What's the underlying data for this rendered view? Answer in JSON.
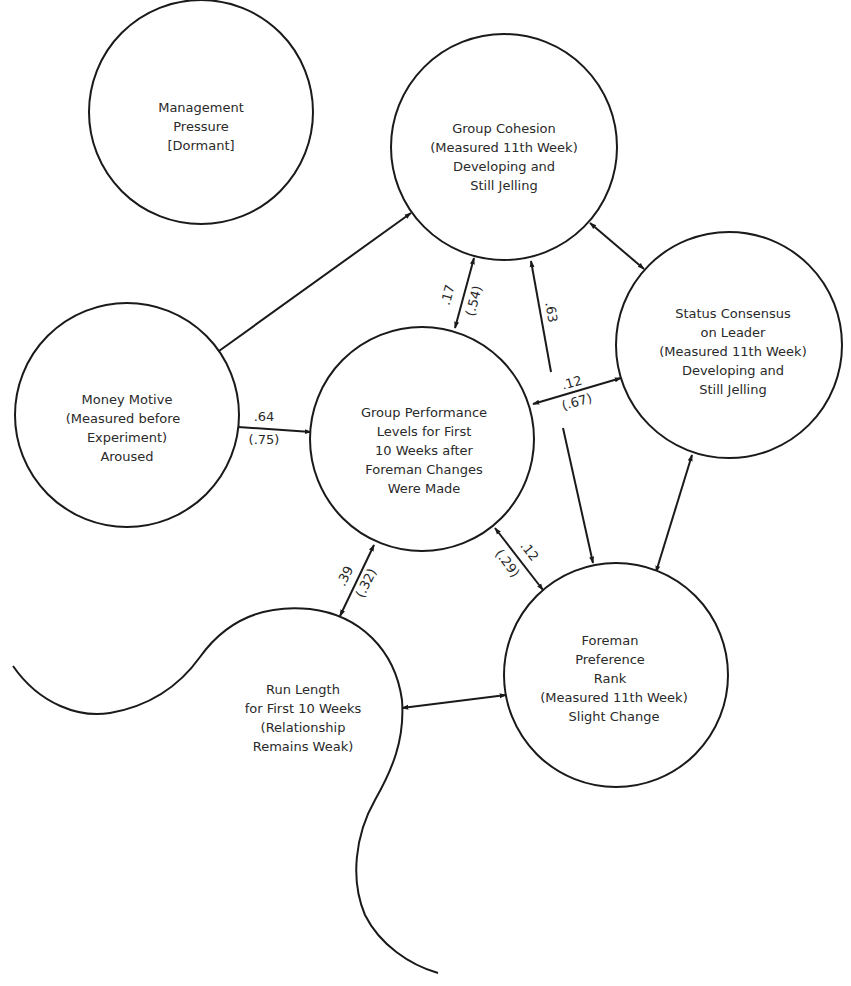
{
  "diagram": {
    "colors": {
      "line": "#1a1a1a",
      "text": "#2a2a2a",
      "background": "#ffffff"
    },
    "nodes": {
      "management_pressure": {
        "lines": [
          "Management",
          "Pressure",
          "[Dormant]"
        ]
      },
      "group_cohesion": {
        "lines": [
          "Group Cohesion",
          "(Measured 11th Week)",
          "Developing and",
          "Still Jelling"
        ]
      },
      "status_consensus": {
        "lines": [
          "Status Consensus",
          "on Leader",
          "(Measured 11th Week)",
          "Developing and",
          "Still Jelling"
        ]
      },
      "money_motive": {
        "lines": [
          "Money Motive",
          "(Measured before",
          "Experiment)",
          "Aroused"
        ]
      },
      "group_performance": {
        "lines": [
          "Group Performance",
          "Levels for First",
          "10 Weeks after",
          "Foreman Changes",
          "Were Made"
        ]
      },
      "foreman_preference": {
        "lines": [
          "Foreman",
          "Preference",
          "Rank",
          "(Measured 11th Week)",
          "Slight Change"
        ]
      },
      "run_length": {
        "lines": [
          "Run Length",
          "for First 10 Weeks",
          "(Relationship",
          "Remains Weak)"
        ]
      }
    },
    "edges": {
      "money_to_performance": {
        "from": "Money Motive",
        "to": "Group Performance",
        "coef": ".64",
        "coef_paren": "(.75)"
      },
      "money_to_cohesion": {
        "from": "Money Motive",
        "to": "Group Cohesion"
      },
      "performance_cohesion": {
        "from": "Group Performance",
        "to": "Group Cohesion",
        "coef": ".17",
        "coef_paren": "(.54)"
      },
      "foreman_to_cohesion": {
        "from": "Foreman Preference",
        "to": "Group Cohesion",
        "coef": ".63"
      },
      "performance_status": {
        "from": "Group Performance",
        "to": "Status Consensus",
        "coef": ".12",
        "coef_paren": "(.67)"
      },
      "cohesion_status": {
        "from": "Group Cohesion",
        "to": "Status Consensus"
      },
      "status_foreman": {
        "from": "Status Consensus",
        "to": "Foreman Preference"
      },
      "performance_foreman": {
        "from": "Group Performance",
        "to": "Foreman Preference",
        "coef": ".12",
        "coef_paren": "(.29)"
      },
      "performance_runlength": {
        "from": "Group Performance",
        "to": "Run Length",
        "coef": ".39",
        "coef_paren": "(.32)"
      },
      "runlength_foreman": {
        "from": "Run Length",
        "to": "Foreman Preference"
      }
    }
  }
}
